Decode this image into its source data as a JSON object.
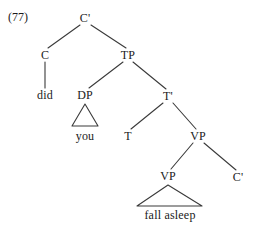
{
  "figure": {
    "example_number": "(77)",
    "type": "syntax-tree",
    "ink_color": "#3a3a3a",
    "text_color": "#1a1a1a",
    "background": "#ffffff"
  },
  "nodes": [
    {
      "id": "c-bar-top",
      "label": "C'",
      "x": 85,
      "y": 18,
      "kind": "category"
    },
    {
      "id": "c",
      "label": "C",
      "x": 45,
      "y": 55,
      "kind": "category"
    },
    {
      "id": "tp",
      "label": "TP",
      "x": 128,
      "y": 55,
      "kind": "category"
    },
    {
      "id": "did",
      "label": "did",
      "x": 45,
      "y": 95,
      "kind": "terminal"
    },
    {
      "id": "dp",
      "label": "DP",
      "x": 85,
      "y": 95,
      "kind": "category"
    },
    {
      "id": "t-bar",
      "label": "T'",
      "x": 168,
      "y": 96,
      "kind": "category"
    },
    {
      "id": "you",
      "label": "you",
      "x": 85,
      "y": 136,
      "kind": "terminal"
    },
    {
      "id": "t",
      "label": "T",
      "x": 128,
      "y": 136,
      "kind": "category"
    },
    {
      "id": "vp-upper",
      "label": "VP",
      "x": 198,
      "y": 136,
      "kind": "category"
    },
    {
      "id": "vp-lower",
      "label": "VP",
      "x": 168,
      "y": 176,
      "kind": "category"
    },
    {
      "id": "c-bar-low",
      "label": "C'",
      "x": 238,
      "y": 177,
      "kind": "category"
    },
    {
      "id": "fall-asleep",
      "label": "fall asleep",
      "x": 170,
      "y": 215,
      "kind": "terminal"
    }
  ],
  "edges": [
    {
      "from": "c-bar-top",
      "to": "c",
      "x1": 80,
      "y1": 25,
      "x2": 48,
      "y2": 48
    },
    {
      "from": "c-bar-top",
      "to": "tp",
      "x1": 91,
      "y1": 25,
      "x2": 126,
      "y2": 48
    },
    {
      "from": "c",
      "to": "did",
      "x1": 45,
      "y1": 62,
      "x2": 45,
      "y2": 88
    },
    {
      "from": "tp",
      "to": "dp",
      "x1": 123,
      "y1": 62,
      "x2": 89,
      "y2": 88
    },
    {
      "from": "tp",
      "to": "t-bar",
      "x1": 133,
      "y1": 62,
      "x2": 166,
      "y2": 89
    },
    {
      "from": "t-bar",
      "to": "t",
      "x1": 163,
      "y1": 103,
      "x2": 131,
      "y2": 129
    },
    {
      "from": "t-bar",
      "to": "vp-upper",
      "x1": 173,
      "y1": 103,
      "x2": 196,
      "y2": 129
    },
    {
      "from": "vp-upper",
      "to": "vp-lower",
      "x1": 193,
      "y1": 143,
      "x2": 171,
      "y2": 169
    },
    {
      "from": "vp-upper",
      "to": "c-bar-low",
      "x1": 204,
      "y1": 143,
      "x2": 236,
      "y2": 170
    }
  ],
  "triangles": [
    {
      "for": "dp",
      "apex_x": 85,
      "apex_y": 104,
      "left_x": 72,
      "right_x": 98,
      "base_y": 126,
      "leaf": "you"
    },
    {
      "for": "vp-lower",
      "apex_x": 168,
      "apex_y": 185,
      "left_x": 137,
      "right_x": 202,
      "base_y": 206,
      "leaf": "fall asleep"
    }
  ]
}
